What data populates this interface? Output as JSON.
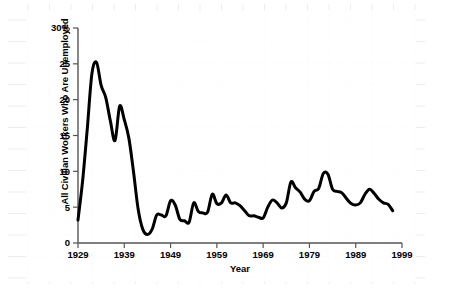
{
  "chart_data": {
    "type": "line",
    "title": "",
    "xlabel": "Year",
    "ylabel": "All Civilian Workers Who Are Unemployed",
    "xlim": [
      1929,
      1999
    ],
    "ylim": [
      0,
      30
    ],
    "xticks": [
      1929,
      1939,
      1949,
      1959,
      1969,
      1979,
      1989,
      1999
    ],
    "xtick_labels": [
      "1929",
      "1939",
      "1949",
      "1959",
      "1969",
      "1979",
      "1989",
      "1999"
    ],
    "yticks": [
      0,
      5,
      10,
      15,
      20,
      25,
      30
    ],
    "ytick_labels": [
      "0",
      "5",
      "10",
      "15",
      "20",
      "25",
      "30%"
    ],
    "grid": true,
    "legend": null,
    "line_color": "#000000",
    "line_width": 3,
    "series": [
      {
        "name": "Unemployment rate",
        "x": [
          1929,
          1930,
          1931,
          1932,
          1933,
          1934,
          1935,
          1936,
          1937,
          1938,
          1939,
          1940,
          1941,
          1942,
          1943,
          1944,
          1945,
          1946,
          1947,
          1948,
          1949,
          1950,
          1951,
          1952,
          1953,
          1954,
          1955,
          1956,
          1957,
          1958,
          1959,
          1960,
          1961,
          1962,
          1963,
          1964,
          1965,
          1966,
          1967,
          1968,
          1969,
          1970,
          1971,
          1972,
          1973,
          1974,
          1975,
          1976,
          1977,
          1978,
          1979,
          1980,
          1981,
          1982,
          1983,
          1984,
          1985,
          1986,
          1987,
          1988,
          1989,
          1990,
          1991,
          1992,
          1993,
          1994,
          1995,
          1996,
          1997
        ],
        "values": [
          3.2,
          8.7,
          15.9,
          23.6,
          25.2,
          22.0,
          20.3,
          17.0,
          14.3,
          19.1,
          17.2,
          14.6,
          9.9,
          4.7,
          1.9,
          1.2,
          1.9,
          3.9,
          3.9,
          3.8,
          5.9,
          5.3,
          3.3,
          3.1,
          2.9,
          5.6,
          4.4,
          4.2,
          4.3,
          6.8,
          5.5,
          5.6,
          6.7,
          5.6,
          5.6,
          5.2,
          4.5,
          3.8,
          3.8,
          3.6,
          3.5,
          5.0,
          6.0,
          5.6,
          4.9,
          5.6,
          8.5,
          7.7,
          7.1,
          6.1,
          5.9,
          7.2,
          7.6,
          9.7,
          9.6,
          7.5,
          7.2,
          7.0,
          6.2,
          5.5,
          5.3,
          5.6,
          6.8,
          7.5,
          6.9,
          6.1,
          5.6,
          5.4,
          4.5
        ]
      }
    ]
  },
  "axes": {
    "x_axis_title": "Year",
    "y_axis_title": "All Civilian Workers Who Are Unemployed"
  }
}
